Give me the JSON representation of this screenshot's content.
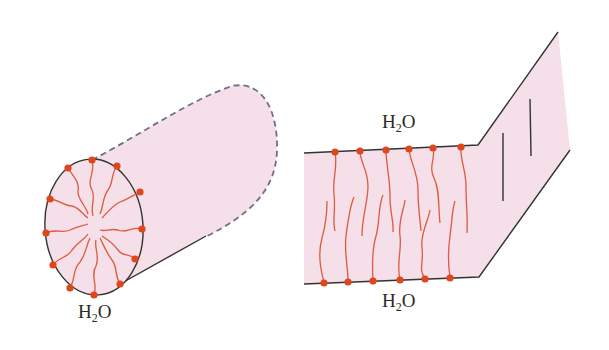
{
  "colors": {
    "fill": "#f5dfe8",
    "outline": "#333333",
    "dashed": "#6f7089",
    "headgroup": "#e0461c",
    "chain": "#de5a40"
  },
  "micelle_cylinder": {
    "label": {
      "main": "H",
      "sub": "2",
      "tail": "O"
    }
  },
  "bilayer": {
    "label_top": {
      "main": "H",
      "sub": "2",
      "tail": "O"
    },
    "label_bottom": {
      "main": "H",
      "sub": "2",
      "tail": "O"
    }
  }
}
